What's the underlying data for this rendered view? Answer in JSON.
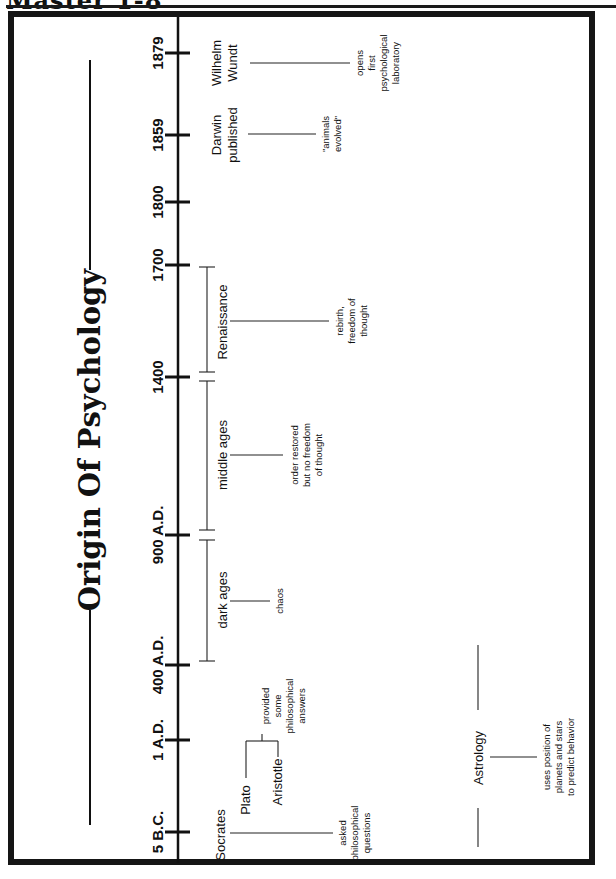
{
  "page": {
    "header": "Master 1-8",
    "title": "Origin Of Psychology"
  },
  "timeline": {
    "ticks": [
      {
        "label": "5 B.C.",
        "y": 832
      },
      {
        "label": "1 A.D.",
        "y": 740
      },
      {
        "label": "400 A.D.",
        "y": 665
      },
      {
        "label": "900 A.D.",
        "y": 535
      },
      {
        "label": "1400",
        "y": 377
      },
      {
        "label": "1700",
        "y": 265
      },
      {
        "label": "1800",
        "y": 202
      },
      {
        "label": "1859",
        "y": 135
      },
      {
        "label": "1879",
        "y": 53
      }
    ],
    "periods": [
      {
        "label": "dark ages",
        "note": [
          "chaos"
        ]
      },
      {
        "label": "middle ages",
        "note": [
          "order restored",
          "but no freedom",
          "of thought"
        ]
      },
      {
        "label": "Renaissance",
        "note": [
          "rebirth,",
          "freedom of",
          "thought"
        ]
      }
    ],
    "events": [
      {
        "label": [
          "Socrates"
        ],
        "note": [
          "asked",
          "philosophical",
          "questions"
        ]
      },
      {
        "label": [
          "Plato"
        ]
      },
      {
        "label": [
          "Aristotle"
        ]
      },
      {
        "group_note": [
          "provided",
          "some",
          "philosophical",
          "answers"
        ]
      },
      {
        "label": [
          "Darwin",
          "published"
        ],
        "note": [
          "\"animals",
          "evolved\""
        ]
      },
      {
        "label": [
          "Wilhelm",
          "Wundt"
        ],
        "note": [
          "opens",
          "first",
          "psychological",
          "laboratory"
        ]
      }
    ],
    "side_topic": {
      "label": "Astrology",
      "note": [
        "uses position of",
        "planets and stars",
        "to predict behavior"
      ]
    }
  }
}
